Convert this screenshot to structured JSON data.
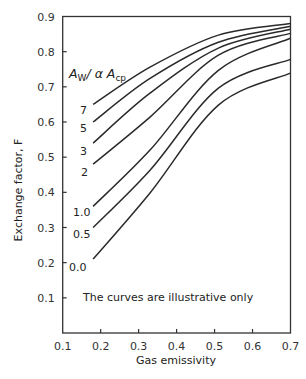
{
  "chart_data": {
    "type": "line",
    "title": "",
    "xlabel": "Gas emissivity",
    "ylabel": "Exchange factor, F",
    "xlim": [
      0.1,
      0.7
    ],
    "ylim": [
      0.0,
      0.9
    ],
    "x_ticks": [
      "0.1",
      "0.2",
      "0.3",
      "0.4",
      "0.5",
      "0.6",
      "0.7"
    ],
    "y_ticks": [
      "0.1",
      "0.2",
      "0.3",
      "0.4",
      "0.5",
      "0.6",
      "0.7",
      "0.8",
      "0.9"
    ],
    "grid": false,
    "legend_title": {
      "main": "A",
      "sub1": "W",
      "mid": "/ α A",
      "sub2": "cp"
    },
    "annotation": "The curves are illustrative only",
    "x": [
      0.18,
      0.33,
      0.51,
      0.7
    ],
    "series": [
      {
        "name": "7",
        "label": "7",
        "values": [
          0.65,
          0.756,
          0.847,
          0.88
        ]
      },
      {
        "name": "5",
        "label": "5",
        "values": [
          0.6,
          0.724,
          0.827,
          0.872
        ]
      },
      {
        "name": "3",
        "label": "3",
        "values": [
          0.54,
          0.682,
          0.81,
          0.864
        ]
      },
      {
        "name": "2",
        "label": "2",
        "values": [
          0.48,
          0.614,
          0.79,
          0.852
        ]
      },
      {
        "name": "1.0",
        "label": "1.0",
        "values": [
          0.36,
          0.52,
          0.747,
          0.838
        ]
      },
      {
        "name": "0.5",
        "label": "0.5",
        "values": [
          0.3,
          0.463,
          0.696,
          0.778
        ]
      },
      {
        "name": "0.0",
        "label": "0.0",
        "values": [
          0.21,
          0.398,
          0.648,
          0.739
        ]
      }
    ]
  }
}
